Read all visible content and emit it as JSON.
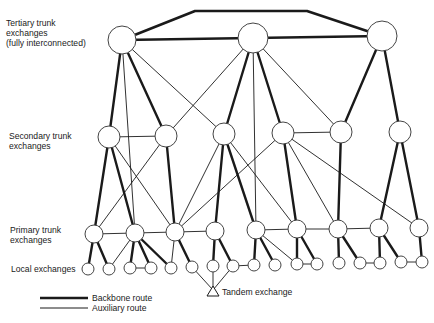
{
  "labels": {
    "tertiary": [
      "Tertiary trunk",
      "exchanges",
      "(fully interconnected)"
    ],
    "secondary": [
      "Secondary trunk",
      "exchanges"
    ],
    "primary": [
      "Primary trunk",
      "exchanges"
    ],
    "local": "Local exchanges",
    "tandem": "Tandem exchange"
  },
  "legend": {
    "backbone": "Backbone route",
    "auxiliary": "Auxiliary route"
  },
  "colors": {
    "line": "#1a1a1a",
    "node_fill": "#ffffff",
    "node_stroke": "#444444"
  },
  "nodes": {
    "tertiary": [
      {
        "id": "T1",
        "x": 122,
        "y": 40,
        "r": 14
      },
      {
        "id": "T2",
        "x": 253,
        "y": 38,
        "r": 15
      },
      {
        "id": "T3",
        "x": 382,
        "y": 36,
        "r": 15
      }
    ],
    "secondary": [
      {
        "id": "S1",
        "x": 109,
        "y": 137,
        "r": 11
      },
      {
        "id": "S2",
        "x": 166,
        "y": 136,
        "r": 11
      },
      {
        "id": "S3",
        "x": 224,
        "y": 134,
        "r": 11
      },
      {
        "id": "S4",
        "x": 283,
        "y": 133,
        "r": 11
      },
      {
        "id": "S5",
        "x": 341,
        "y": 132,
        "r": 11
      },
      {
        "id": "S6",
        "x": 400,
        "y": 132,
        "r": 11
      }
    ],
    "primary": [
      {
        "id": "P1",
        "x": 94,
        "y": 234,
        "r": 9
      },
      {
        "id": "P2",
        "x": 135,
        "y": 233,
        "r": 9
      },
      {
        "id": "P3",
        "x": 175,
        "y": 232,
        "r": 9
      },
      {
        "id": "P4",
        "x": 215,
        "y": 231,
        "r": 9
      },
      {
        "id": "P5",
        "x": 256,
        "y": 230,
        "r": 9
      },
      {
        "id": "P6",
        "x": 297,
        "y": 229,
        "r": 9
      },
      {
        "id": "P7",
        "x": 338,
        "y": 229,
        "r": 9
      },
      {
        "id": "P8",
        "x": 379,
        "y": 228,
        "r": 9
      },
      {
        "id": "P9",
        "x": 419,
        "y": 228,
        "r": 9
      }
    ],
    "local": [
      {
        "id": "L1",
        "x": 88,
        "y": 269,
        "r": 6
      },
      {
        "id": "L2",
        "x": 109,
        "y": 269,
        "r": 6
      },
      {
        "id": "L3",
        "x": 130,
        "y": 268,
        "r": 6
      },
      {
        "id": "L4",
        "x": 151,
        "y": 268,
        "r": 6
      },
      {
        "id": "L5",
        "x": 171,
        "y": 268,
        "r": 6
      },
      {
        "id": "L6",
        "x": 192,
        "y": 267,
        "r": 6
      },
      {
        "id": "L7",
        "x": 213,
        "y": 266,
        "r": 6
      },
      {
        "id": "L8",
        "x": 233,
        "y": 266,
        "r": 6
      },
      {
        "id": "L9",
        "x": 254,
        "y": 265,
        "r": 6
      },
      {
        "id": "L10",
        "x": 275,
        "y": 265,
        "r": 6
      },
      {
        "id": "L11",
        "x": 297,
        "y": 264,
        "r": 6
      },
      {
        "id": "L12",
        "x": 317,
        "y": 264,
        "r": 6
      },
      {
        "id": "L13",
        "x": 339,
        "y": 263,
        "r": 6
      },
      {
        "id": "L14",
        "x": 360,
        "y": 263,
        "r": 6
      },
      {
        "id": "L15",
        "x": 380,
        "y": 263,
        "r": 6
      },
      {
        "id": "L16",
        "x": 401,
        "y": 262,
        "r": 6
      },
      {
        "id": "L17",
        "x": 422,
        "y": 262,
        "r": 6
      }
    ],
    "tandem": {
      "id": "TD",
      "x": 213,
      "y": 292
    }
  },
  "routes": {
    "backbone": [
      [
        "T1",
        "S1"
      ],
      [
        "T1",
        "S2"
      ],
      [
        "T2",
        "S3"
      ],
      [
        "T2",
        "S4"
      ],
      [
        "T3",
        "S5"
      ],
      [
        "T3",
        "S6"
      ],
      [
        "S1",
        "P1"
      ],
      [
        "S1",
        "P2"
      ],
      [
        "S2",
        "P3"
      ],
      [
        "S3",
        "P4"
      ],
      [
        "S3",
        "P5"
      ],
      [
        "S4",
        "P6"
      ],
      [
        "S5",
        "P7"
      ],
      [
        "S6",
        "P8"
      ],
      [
        "S6",
        "P9"
      ],
      [
        "P1",
        "L1"
      ],
      [
        "P1",
        "L2"
      ],
      [
        "P2",
        "L3"
      ],
      [
        "P2",
        "L4"
      ],
      [
        "P2",
        "L5"
      ],
      [
        "P3",
        "L6"
      ],
      [
        "P4",
        "L7"
      ],
      [
        "P4",
        "L8"
      ],
      [
        "P5",
        "L9"
      ],
      [
        "P5",
        "L10"
      ],
      [
        "P6",
        "L11"
      ],
      [
        "P6",
        "L12"
      ],
      [
        "P7",
        "L13"
      ],
      [
        "P7",
        "L14"
      ],
      [
        "P8",
        "L15"
      ],
      [
        "P8",
        "L16"
      ],
      [
        "P9",
        "L17"
      ]
    ],
    "auxiliary": [
      [
        "T1",
        "P2"
      ],
      [
        "T1",
        "S3"
      ],
      [
        "T2",
        "S2"
      ],
      [
        "T2",
        "P5"
      ],
      [
        "T2",
        "S5"
      ],
      [
        "S1",
        "S2"
      ],
      [
        "S4",
        "S5"
      ],
      [
        "S1",
        "P3"
      ],
      [
        "S2",
        "P1"
      ],
      [
        "S3",
        "P3"
      ],
      [
        "S3",
        "P6"
      ],
      [
        "S4",
        "P3"
      ],
      [
        "S4",
        "P7"
      ],
      [
        "S4",
        "P9"
      ],
      [
        "P1",
        "P2"
      ],
      [
        "P2",
        "P3"
      ],
      [
        "P3",
        "P4"
      ],
      [
        "P5",
        "P6"
      ],
      [
        "P6",
        "P7"
      ],
      [
        "P7",
        "P8"
      ],
      [
        "P2",
        "L2"
      ],
      [
        "P3",
        "L5"
      ],
      [
        "P5",
        "L11"
      ],
      [
        "L3",
        "L4"
      ],
      [
        "L8",
        "L9"
      ],
      [
        "L11",
        "L12"
      ],
      [
        "L14",
        "L15"
      ],
      [
        "L16",
        "L17"
      ],
      [
        "L6",
        "TD"
      ],
      [
        "L7",
        "TD"
      ],
      [
        "L8",
        "TD"
      ]
    ],
    "tertiary_mesh": {
      "T1_T2": [
        [
          122,
          40
        ],
        [
          253,
          38
        ]
      ],
      "T2_T3": [
        [
          253,
          38
        ],
        [
          382,
          36
        ]
      ],
      "T1_T3_over_top": [
        [
          122,
          40
        ],
        [
          195,
          11
        ],
        [
          307,
          11
        ],
        [
          382,
          36
        ]
      ]
    }
  }
}
